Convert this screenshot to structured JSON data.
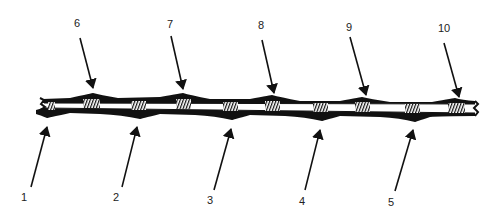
{
  "diagram": {
    "type": "labeled-strip-illustration",
    "stroke_color": "#111111",
    "labels": [
      {
        "id": "1",
        "text": "1",
        "x": 24,
        "y": 197,
        "tip": [
          47,
          127
        ],
        "tail": [
          31,
          187
        ]
      },
      {
        "id": "2",
        "text": "2",
        "x": 116,
        "y": 197,
        "tip": [
          137,
          127
        ],
        "tail": [
          122,
          187
        ]
      },
      {
        "id": "3",
        "text": "3",
        "x": 210,
        "y": 200,
        "tip": [
          231,
          129
        ],
        "tail": [
          214,
          190
        ]
      },
      {
        "id": "4",
        "text": "4",
        "x": 302,
        "y": 201,
        "tip": [
          320,
          130
        ],
        "tail": [
          305,
          190
        ]
      },
      {
        "id": "5",
        "text": "5",
        "x": 391,
        "y": 202,
        "tip": [
          413,
          130
        ],
        "tail": [
          395,
          191
        ]
      },
      {
        "id": "6",
        "text": "6",
        "x": 77,
        "y": 23,
        "tip": [
          93,
          88
        ],
        "tail": [
          80,
          38
        ]
      },
      {
        "id": "7",
        "text": "7",
        "x": 170,
        "y": 24,
        "tip": [
          183,
          89
        ],
        "tail": [
          171,
          36
        ]
      },
      {
        "id": "8",
        "text": "8",
        "x": 261,
        "y": 25,
        "tip": [
          274,
          93
        ],
        "tail": [
          262,
          40
        ]
      },
      {
        "id": "9",
        "text": "9",
        "x": 349,
        "y": 27,
        "tip": [
          366,
          95
        ],
        "tail": [
          350,
          37
        ]
      },
      {
        "id": "10",
        "text": "10",
        "x": 444,
        "y": 28,
        "tip": [
          459,
          97
        ],
        "tail": [
          444,
          43
        ]
      }
    ]
  }
}
